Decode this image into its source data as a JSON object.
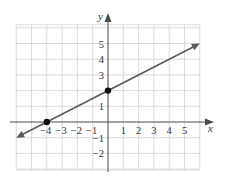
{
  "chart_data": {
    "type": "line",
    "title": "",
    "xlabel": "x",
    "ylabel": "y",
    "xlim": [
      -6,
      6
    ],
    "ylim": [
      -3,
      6
    ],
    "grid": true,
    "x_ticks": [
      -4,
      -3,
      -2,
      -1,
      1,
      2,
      3,
      4,
      5
    ],
    "x_tick_labels": [
      "−4",
      "−3",
      "−2",
      "−1",
      "1",
      "2",
      "3",
      "4",
      "5"
    ],
    "y_ticks": [
      5,
      4,
      3,
      1,
      -1,
      -2
    ],
    "y_tick_labels": [
      "5",
      "4",
      "3",
      "1",
      "−1",
      "−2"
    ],
    "series": [
      {
        "name": "line",
        "equation": "y = 0.5x + 2",
        "x": [
          -6,
          6
        ],
        "y": [
          -1,
          5
        ],
        "arrows": "both",
        "color": "#5a5a5a"
      }
    ],
    "points": [
      {
        "x": -4,
        "y": 0,
        "label": "x-intercept"
      },
      {
        "x": 0,
        "y": 2,
        "label": "y-intercept"
      }
    ]
  },
  "labels": {
    "x_axis": "x",
    "y_axis": "y"
  }
}
